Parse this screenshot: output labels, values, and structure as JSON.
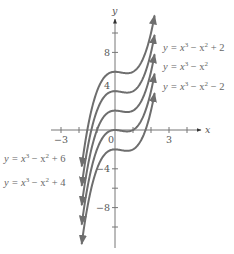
{
  "chart_data": {
    "type": "line",
    "title": "",
    "xlabel": "x",
    "ylabel": "y",
    "xlim": [
      -3.4,
      4.8
    ],
    "ylim": [
      -12.8,
      11.6
    ],
    "x_ticks": [
      -3,
      -2,
      -1,
      0,
      1,
      2,
      3,
      4
    ],
    "x_tick_labels": [
      {
        "value": -3,
        "text": "−3"
      },
      {
        "value": 0,
        "text": "0"
      },
      {
        "value": 3,
        "text": "3"
      }
    ],
    "y_ticks": [
      -10,
      -8,
      -6,
      -4,
      -2,
      0,
      2,
      4,
      6,
      8,
      10
    ],
    "y_tick_labels": [
      {
        "value": 8,
        "text": "8"
      },
      {
        "value": 4,
        "text": "4"
      },
      {
        "value": -4,
        "text": "−4"
      },
      {
        "value": -8,
        "text": "−8"
      }
    ],
    "grid": false,
    "curve_x_range": [
      -1.85,
      2.2
    ],
    "series": [
      {
        "name": "y = x³ − x² + 6",
        "c": 6,
        "label_side": "left",
        "label_y": 158
      },
      {
        "name": "y = x³ − x² + 4",
        "c": 4,
        "label_side": "left",
        "label_y": 182
      },
      {
        "name": "y = x³ − x² + 2",
        "c": 2,
        "label_side": "right",
        "label_y": 47
      },
      {
        "name": "y = x³ − x²",
        "c": 0,
        "label_side": "right",
        "label_y": 66
      },
      {
        "name": "y = x³ − x² − 2",
        "c": -2,
        "label_side": "right",
        "label_y": 86
      }
    ],
    "colors": {
      "curve": "#6e6e6e",
      "axis": "#777777",
      "text": "#555555"
    }
  },
  "labels": {
    "right": [
      {
        "pre": "y = x",
        "sup1": "3",
        "mid": " −  x",
        "sup2": "2",
        "post": " + 2"
      },
      {
        "pre": "y = x",
        "sup1": "3",
        "mid": " −  x",
        "sup2": "2",
        "post": ""
      },
      {
        "pre": "y = x",
        "sup1": "3",
        "mid": " −  x",
        "sup2": "2",
        "post": " − 2"
      }
    ],
    "left": [
      {
        "pre": "y = x",
        "sup1": "3",
        "mid": " −  x",
        "sup2": "2",
        "post": " + 6"
      },
      {
        "pre": "y = x",
        "sup1": "3",
        "mid": " −  x",
        "sup2": "2",
        "post": " + 4"
      }
    ]
  }
}
